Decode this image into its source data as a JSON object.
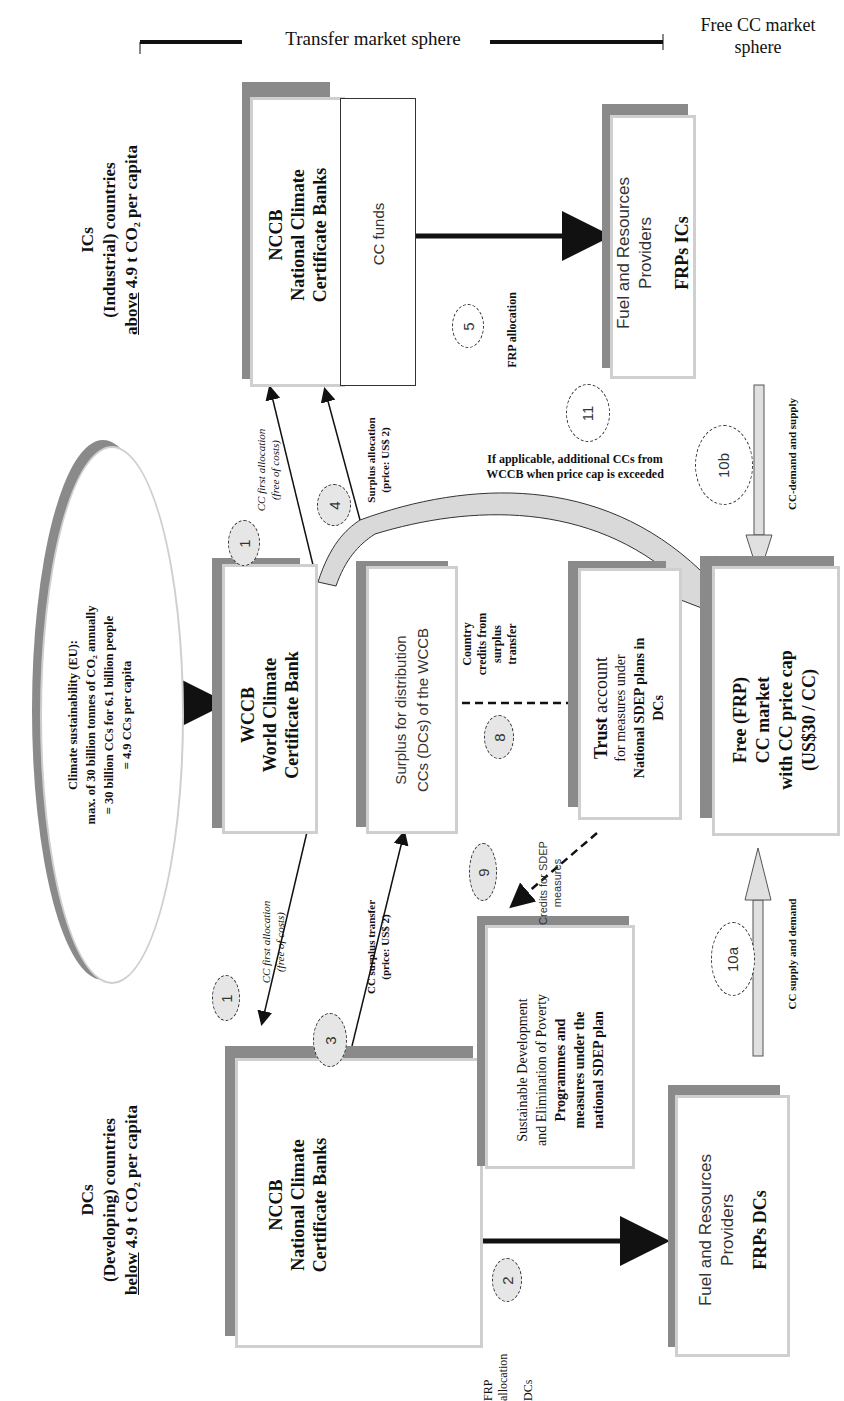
{
  "header": {
    "transfer_sphere": "Transfer market sphere",
    "free_sphere_line1": "Free CC market",
    "free_sphere_line2": "sphere"
  },
  "groups": {
    "ics": {
      "line1": "ICs",
      "line2": "(Industrial) countries",
      "line3_underlined": "above",
      "line3_rest": " 4.9 t CO₂ per capita"
    },
    "dcs": {
      "line1": "DCs",
      "line2": "(Developing) countries",
      "line3_underlined": "below",
      "line3_rest": " 4.9 t CO₂ per capita"
    }
  },
  "ellipse": {
    "line1": "Climate sustainability (EU):",
    "line2": "max. of 30 billion tonnes of CO₂ annually",
    "line3": "= 30 billion CCs for 6.1 billion people",
    "line4": "= 4.9 CCs per capita"
  },
  "boxes": {
    "nccb_ic": {
      "line1": "NCCB",
      "line2": "National Climate",
      "line3": "Certificate Banks",
      "funds": "CC funds"
    },
    "frp_ic": {
      "line1": "Fuel and Resources",
      "line2": "Providers",
      "line3": "FRPs ICs"
    },
    "wccb": {
      "line1": "WCCB",
      "line2": "World Climate",
      "line3": "Certificate Bank"
    },
    "surplus": {
      "line1": "Surplus for distribution",
      "line2": "CCs (DCs) of the WCCB"
    },
    "trust": {
      "line1_bold": "Trust",
      "line1_rest": " account",
      "line2": "for measures under",
      "line3": "National SDEP plans in",
      "line4": "DCs"
    },
    "free_market": {
      "line1": "Free (FRP)",
      "line2": "CC market",
      "line3": "with CC price cap",
      "line4": "(US$30 / CC)"
    },
    "nccb_dc": {
      "line1": "NCCB",
      "line2": "National Climate",
      "line3": "Certificate Banks"
    },
    "sdep": {
      "line1": "Sustainable Development",
      "line2": "and Elimination of Poverty",
      "line3": "Programmes and",
      "line4": "measures under the",
      "line5": "national SDEP plan"
    },
    "frp_dc": {
      "line1": "Fuel and Resources",
      "line2": "Providers",
      "line3": "FRPs DCs"
    }
  },
  "labels": {
    "first_alloc_ic_1": "CC first allocation",
    "first_alloc_ic_2": "(free of costs)",
    "surplus_alloc_1": "Surplus allocation",
    "surplus_alloc_2": "(price: US$ 2)",
    "frp_alloc_ic": "FRP allocation",
    "additional_1": "If applicable, additional CCs from",
    "additional_2": "WCCB when price cap is exceeded",
    "demand_supply": "CC-demand and supply",
    "country_credits_1": "Country",
    "country_credits_2": "credits from",
    "country_credits_3": "surplus",
    "country_credits_4": "transfer",
    "credits_sdep_1": "Credits for SDEP",
    "credits_sdep_2": "measures",
    "first_alloc_dc_1": "CC first allocation",
    "first_alloc_dc_2": "(free of costs)",
    "surplus_transfer_1": "CC surplus transfer",
    "surplus_transfer_2": "(price: US$ 2)",
    "supply_demand": "CC supply and demand",
    "frp_alloc_dc_1": "FRP",
    "frp_alloc_dc_2": "allocation",
    "frp_alloc_dc_3": "DCs"
  },
  "steps": [
    "1",
    "1",
    "2",
    "3",
    "4",
    "5",
    "8",
    "9",
    "10a",
    "10b",
    "11"
  ],
  "colors": {
    "shadow": "#8a8a8a",
    "border": "#cfcfcf",
    "bubble": "#e6e6e6",
    "arrow_fill": "#e0e0e0"
  }
}
